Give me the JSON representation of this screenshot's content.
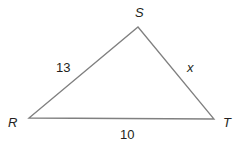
{
  "diagram": {
    "type": "triangle",
    "stroke_color": "#808080",
    "text_color": "#231f20",
    "vertices": [
      {
        "name": "R",
        "x": 29,
        "y": 118
      },
      {
        "name": "S",
        "x": 138,
        "y": 27
      },
      {
        "name": "T",
        "x": 214,
        "y": 119
      }
    ],
    "vertex_labels": {
      "R": "R",
      "S": "S",
      "T": "T"
    },
    "side_labels": {
      "RS": "13",
      "ST": "x",
      "RT": "10"
    }
  }
}
